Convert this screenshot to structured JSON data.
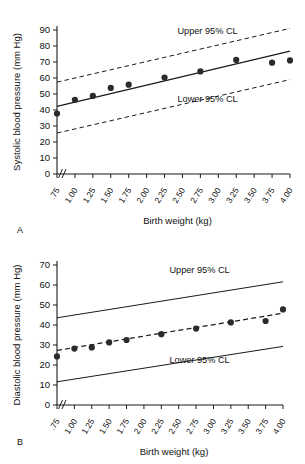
{
  "figure": {
    "panel_a_letter": "A",
    "panel_b_letter": "B"
  },
  "chart_data": [
    {
      "type": "scatter",
      "panel": "A",
      "title": "",
      "xlabel": "Birth weight (kg)",
      "ylabel": "Systolic blood pressure (mm Hg)",
      "xlim": [
        0.75,
        4.0
      ],
      "ylim": [
        0,
        90
      ],
      "yticks": [
        0,
        10,
        20,
        30,
        40,
        50,
        60,
        70,
        80,
        90
      ],
      "xticks": [
        ".75",
        "1.00",
        "1.25",
        "1.50",
        "1.75",
        "2.00",
        "2.25",
        "2.50",
        "2.75",
        "3.00",
        "3.25",
        "3.50",
        "3.75",
        "4.00"
      ],
      "axis_break": true,
      "grid": false,
      "x": [
        0.75,
        1.0,
        1.25,
        1.5,
        1.75,
        2.0,
        2.25,
        2.5,
        2.75,
        3.0,
        3.25,
        3.5,
        3.75
      ],
      "values": [
        37.8,
        46.4,
        48.8,
        53.8,
        55.8,
        55.9,
        60.3,
        60.4,
        64.1,
        64.2,
        71.3,
        69.6,
        71.0
      ],
      "series": [
        {
          "name": "Observed mean systolic blood pressure",
          "style": "points",
          "x": [
            0.75,
            1.0,
            1.25,
            1.5,
            1.75,
            2.25,
            2.75,
            3.25,
            3.75,
            4.0
          ],
          "values": [
            37.8,
            46.4,
            48.8,
            53.8,
            55.8,
            60.3,
            64.1,
            71.3,
            69.6,
            71.0
          ]
        },
        {
          "name": "Regression line",
          "style": "solid-line",
          "endpoints_x": [
            0.75,
            4.0
          ],
          "endpoints_y": [
            42.3,
            76.8
          ]
        },
        {
          "name": "Upper 95% CL",
          "style": "dashed-line",
          "endpoints_x": [
            0.75,
            4.0
          ],
          "endpoints_y": [
            57.4,
            91.0
          ]
        },
        {
          "name": "Lower 95% CL",
          "style": "dashed-line",
          "endpoints_x": [
            0.75,
            4.0
          ],
          "endpoints_y": [
            25.6,
            59.0
          ]
        }
      ],
      "annotations": [
        {
          "text": "Upper 95% CL",
          "x": 2.85,
          "y": 87.5
        },
        {
          "text": "Lower 95% CL",
          "x": 2.85,
          "y": 45.0
        }
      ]
    },
    {
      "type": "scatter",
      "panel": "B",
      "title": "",
      "xlabel": "Birth weight (kg)",
      "ylabel": "Diastolic blood pressure (mm Hg)",
      "xlim": [
        0.75,
        4.0
      ],
      "ylim": [
        0,
        70
      ],
      "yticks": [
        0,
        10,
        20,
        30,
        40,
        50,
        60,
        70
      ],
      "xticks": [
        ".75",
        "1.00",
        "1.25",
        "1.50",
        "1.75",
        "2.00",
        "2.25",
        "2.50",
        "2.75",
        "3.00",
        "3.25",
        "3.50",
        "3.75",
        "4.00"
      ],
      "axis_break": true,
      "grid": false,
      "x": [
        0.75,
        1.0,
        1.25,
        1.5,
        1.75,
        2.25,
        2.75,
        3.25,
        3.75,
        4.0
      ],
      "values": [
        24.3,
        28.2,
        28.8,
        31.3,
        32.5,
        35.4,
        38.2,
        41.3,
        42.0,
        47.8
      ],
      "series": [
        {
          "name": "Observed mean diastolic blood pressure",
          "style": "points",
          "x": [
            0.75,
            1.0,
            1.25,
            1.5,
            1.75,
            2.25,
            2.75,
            3.25,
            3.75,
            4.0
          ],
          "values": [
            24.3,
            28.2,
            28.8,
            31.3,
            32.5,
            35.4,
            38.2,
            41.3,
            42.0,
            47.8
          ]
        },
        {
          "name": "Regression line",
          "style": "dashed-line",
          "endpoints_x": [
            0.75,
            4.0
          ],
          "endpoints_y": [
            27.3,
            45.9
          ]
        },
        {
          "name": "Upper 95% CL",
          "style": "solid-line",
          "endpoints_x": [
            0.75,
            4.0
          ],
          "endpoints_y": [
            43.6,
            61.6
          ]
        },
        {
          "name": "Lower 95% CL",
          "style": "solid-line",
          "endpoints_x": [
            0.75,
            4.0
          ],
          "endpoints_y": [
            11.6,
            29.3
          ]
        }
      ],
      "annotations": [
        {
          "text": "Upper 95% CL",
          "x": 2.8,
          "y": 66.0
        },
        {
          "text": "Lower 95% CL",
          "x": 2.8,
          "y": 21.0
        }
      ]
    }
  ]
}
